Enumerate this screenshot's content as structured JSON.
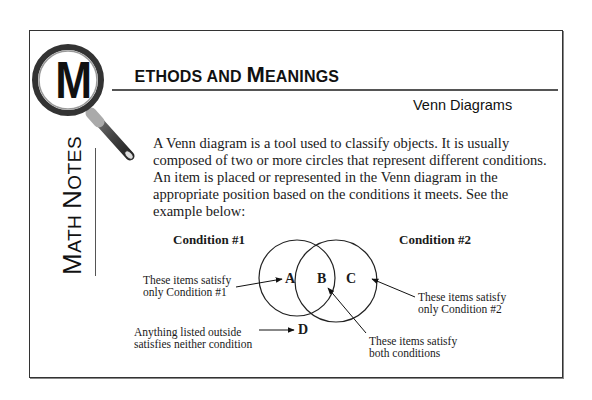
{
  "header": {
    "title_cap1": "M",
    "title_rest1": "ETHODS AND ",
    "title_cap2": "M",
    "title_rest2": "EANINGS",
    "subtitle": "Venn Diagrams"
  },
  "sidebar": {
    "cap1": "M",
    "rest1": "ATH ",
    "cap2": "N",
    "rest2": "OTES",
    "logo_icon": "magnifying-glass-icon",
    "logo_letter": "M"
  },
  "body": {
    "paragraph": "A Venn diagram is a tool used to classify objects.  It is usually composed of two or more circles that represent different conditions. An item is placed or represented in the Venn diagram in the appropriate position based on the conditions it meets.  See the example below:"
  },
  "diagram": {
    "condition1": "Condition #1",
    "condition2": "Condition #2",
    "regions": {
      "a": "A",
      "b": "B",
      "c": "C",
      "d": "D"
    },
    "annotations": {
      "only1_line1": "These items satisfy",
      "only1_line2": "only Condition #1",
      "only2_line1": "These items satisfy",
      "only2_line2": "only Condition #2",
      "both_line1": "These items satisfy",
      "both_line2": "both conditions",
      "outside_line1": "Anything listed outside",
      "outside_line2": "satisfies neither condition"
    }
  }
}
